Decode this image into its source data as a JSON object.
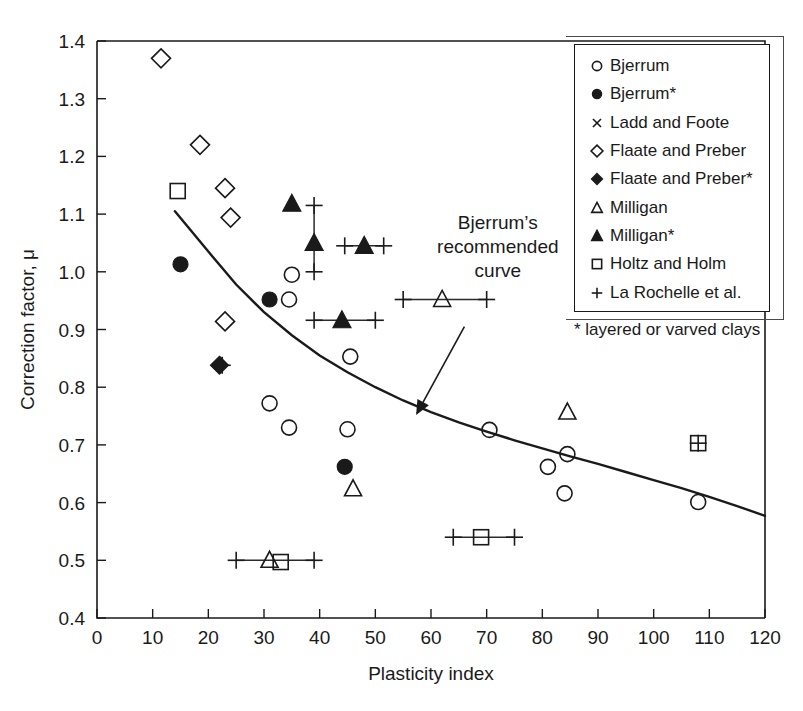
{
  "chart_data": {
    "type": "scatter",
    "title": "",
    "xlabel": "Plasticity index",
    "ylabel": "Correction factor, μ",
    "xlim": [
      0,
      120
    ],
    "ylim": [
      0.4,
      1.4
    ],
    "xticks": [
      0,
      10,
      20,
      30,
      40,
      50,
      60,
      70,
      80,
      90,
      100,
      110,
      120
    ],
    "yticks": [
      "0.4",
      "0.5",
      "0.6",
      "0.7",
      "0.8",
      "0.9",
      "1.0",
      "1.1",
      "1.2",
      "1.3",
      "1.4"
    ],
    "grid": false,
    "legend_position": "upper-right",
    "series": [
      {
        "name": "Bjerrum",
        "marker": "open-circle",
        "points": [
          {
            "x": 35,
            "y": 0.995
          },
          {
            "x": 34.5,
            "y": 0.952
          },
          {
            "x": 45.5,
            "y": 0.853
          },
          {
            "x": 31,
            "y": 0.772
          },
          {
            "x": 34.5,
            "y": 0.73
          },
          {
            "x": 45,
            "y": 0.727
          },
          {
            "x": 70.5,
            "y": 0.726
          },
          {
            "x": 84.5,
            "y": 0.684
          },
          {
            "x": 81,
            "y": 0.662
          },
          {
            "x": 84,
            "y": 0.616
          },
          {
            "x": 108,
            "y": 0.601
          }
        ]
      },
      {
        "name": "Bjerrum*",
        "marker": "filled-circle",
        "points": [
          {
            "x": 15,
            "y": 1.013
          },
          {
            "x": 31,
            "y": 0.952
          },
          {
            "x": 44.5,
            "y": 0.662
          }
        ]
      },
      {
        "name": "Ladd and Foote",
        "marker": "cross-x",
        "points": []
      },
      {
        "name": "Flaate and Preber",
        "marker": "open-diamond",
        "points": [
          {
            "x": 11.5,
            "y": 1.37
          },
          {
            "x": 18.5,
            "y": 1.22
          },
          {
            "x": 23,
            "y": 1.145
          },
          {
            "x": 24,
            "y": 1.094
          },
          {
            "x": 23,
            "y": 0.914
          }
        ]
      },
      {
        "name": "Flaate and Preber*",
        "marker": "filled-diamond",
        "points": [
          {
            "x": 22,
            "y": 0.838
          }
        ]
      },
      {
        "name": "Milligan",
        "marker": "open-triangle",
        "points": [
          {
            "x": 62,
            "y": 0.952
          },
          {
            "x": 84.5,
            "y": 0.757
          },
          {
            "x": 46,
            "y": 0.624
          },
          {
            "x": 31,
            "y": 0.5
          }
        ]
      },
      {
        "name": "Milligan*",
        "marker": "filled-triangle",
        "points": [
          {
            "x": 35,
            "y": 1.118
          },
          {
            "x": 39,
            "y": 1.05
          },
          {
            "x": 48,
            "y": 1.045
          },
          {
            "x": 44,
            "y": 0.916
          }
        ]
      },
      {
        "name": "Holtz and Holm",
        "marker": "open-square",
        "points": [
          {
            "x": 14.5,
            "y": 1.14
          },
          {
            "x": 69,
            "y": 0.54
          },
          {
            "x": 33,
            "y": 0.497
          },
          {
            "x": 108,
            "y": 0.703
          }
        ]
      },
      {
        "name": "La Rochelle et al.",
        "marker": "plus",
        "points": [
          {
            "x": 22.5,
            "y": 0.838
          },
          {
            "x": 108,
            "y": 0.703
          }
        ],
        "error_bars": [
          {
            "orientation": "vertical",
            "x": 39,
            "y": 1.05,
            "low": 1.0,
            "high": 1.115
          },
          {
            "orientation": "horizontal",
            "y": 1.045,
            "x": 48,
            "low": 44.5,
            "high": 51.5
          },
          {
            "orientation": "horizontal",
            "y": 0.916,
            "x": 44,
            "low": 39,
            "high": 50
          },
          {
            "orientation": "horizontal",
            "y": 0.952,
            "x": 62,
            "low": 55,
            "high": 70
          },
          {
            "orientation": "horizontal",
            "y": 0.54,
            "x": 69,
            "low": 64,
            "high": 75
          },
          {
            "orientation": "horizontal",
            "y": 0.5,
            "x": 32,
            "low": 25,
            "high": 39
          }
        ]
      }
    ],
    "curve": {
      "name": "Bjerrum's recommended curve",
      "points": [
        {
          "x": 14,
          "y": 1.105
        },
        {
          "x": 20,
          "y": 1.035
        },
        {
          "x": 25,
          "y": 0.978
        },
        {
          "x": 30,
          "y": 0.93
        },
        {
          "x": 35,
          "y": 0.89
        },
        {
          "x": 40,
          "y": 0.855
        },
        {
          "x": 45,
          "y": 0.826
        },
        {
          "x": 50,
          "y": 0.8
        },
        {
          "x": 55,
          "y": 0.777
        },
        {
          "x": 60,
          "y": 0.757
        },
        {
          "x": 65,
          "y": 0.739
        },
        {
          "x": 70,
          "y": 0.723
        },
        {
          "x": 75,
          "y": 0.708
        },
        {
          "x": 80,
          "y": 0.694
        },
        {
          "x": 85,
          "y": 0.68
        },
        {
          "x": 90,
          "y": 0.667
        },
        {
          "x": 95,
          "y": 0.653
        },
        {
          "x": 100,
          "y": 0.639
        },
        {
          "x": 105,
          "y": 0.625
        },
        {
          "x": 110,
          "y": 0.61
        },
        {
          "x": 115,
          "y": 0.594
        },
        {
          "x": 120,
          "y": 0.577
        }
      ]
    },
    "annotation": {
      "lines": [
        "Bjerrum’s",
        "recommended",
        "curve"
      ],
      "text_x": 72,
      "text_y": 1.075,
      "arrow_from": {
        "x": 66,
        "y": 0.905
      },
      "arrow_to": {
        "x": 57.5,
        "y": 0.755
      }
    }
  },
  "legend": {
    "items": [
      {
        "label": "Bjerrum",
        "marker": "open-circle"
      },
      {
        "label": "Bjerrum*",
        "marker": "filled-circle"
      },
      {
        "label": "Ladd and Foote",
        "marker": "cross-x"
      },
      {
        "label": "Flaate and Preber",
        "marker": "open-diamond"
      },
      {
        "label": "Flaate and Preber*",
        "marker": "filled-diamond"
      },
      {
        "label": "Milligan",
        "marker": "open-triangle"
      },
      {
        "label": "Milligan*",
        "marker": "filled-triangle"
      },
      {
        "label": "Holtz and Holm",
        "marker": "open-square"
      },
      {
        "label": "La Rochelle et al.",
        "marker": "plus"
      }
    ],
    "footnote": "* layered or varved clays"
  },
  "colors": {
    "ink": "#1a1a1a",
    "background": "#ffffff"
  }
}
